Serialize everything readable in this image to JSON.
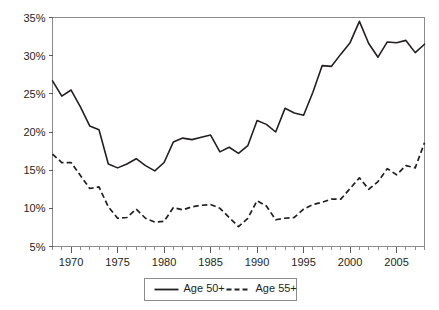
{
  "chart_data": {
    "type": "line",
    "title": "",
    "subtitle": "",
    "xlabel": "",
    "ylabel": "",
    "xlim": [
      1968,
      2008
    ],
    "ylim": [
      5,
      35
    ],
    "y_tick_labels": [
      "5%",
      "10%",
      "15%",
      "20%",
      "25%",
      "30%",
      "35%"
    ],
    "y_tick_values": [
      5,
      10,
      15,
      20,
      25,
      30,
      35
    ],
    "x_tick_labels": [
      "1970",
      "1975",
      "1980",
      "1985",
      "1990",
      "1995",
      "2000",
      "2005"
    ],
    "x_tick_values": [
      1970,
      1975,
      1980,
      1985,
      1990,
      1995,
      2000,
      2005
    ],
    "x_minor_tick_interval": 1,
    "grid": false,
    "legend_position": "bottom",
    "x": [
      1968,
      1969,
      1970,
      1971,
      1972,
      1973,
      1974,
      1975,
      1976,
      1977,
      1978,
      1979,
      1980,
      1981,
      1982,
      1983,
      1984,
      1985,
      1986,
      1987,
      1988,
      1989,
      1990,
      1991,
      1992,
      1993,
      1994,
      1995,
      1996,
      1997,
      1998,
      1999,
      2000,
      2001,
      2002,
      2003,
      2004,
      2005,
      2006,
      2007,
      2008
    ],
    "series": [
      {
        "name": "Age 50+",
        "style": "solid",
        "color": "#231f20",
        "values": [
          26.7,
          24.7,
          25.5,
          23.3,
          20.8,
          20.3,
          15.8,
          15.3,
          15.8,
          16.5,
          15.6,
          14.9,
          16.0,
          18.7,
          19.2,
          19.0,
          19.3,
          19.6,
          17.4,
          18.0,
          17.2,
          18.2,
          21.5,
          21.0,
          20.0,
          23.1,
          22.5,
          22.2,
          25.2,
          28.7,
          28.6,
          30.2,
          31.7,
          34.5,
          31.6,
          29.8,
          31.8,
          31.7,
          32.0,
          30.4,
          31.5
        ]
      },
      {
        "name": "Age 55+",
        "style": "dashed",
        "color": "#231f20",
        "values": [
          17.1,
          16.0,
          16.0,
          14.3,
          12.6,
          12.8,
          10.2,
          8.7,
          8.8,
          9.9,
          8.7,
          8.2,
          8.3,
          10.1,
          9.8,
          10.2,
          10.4,
          10.5,
          10.0,
          8.8,
          7.6,
          8.7,
          11.0,
          10.3,
          8.5,
          8.7,
          8.8,
          9.9,
          10.5,
          10.8,
          11.2,
          11.2,
          12.6,
          14.0,
          12.5,
          13.5,
          15.2,
          14.4,
          15.6,
          15.3,
          18.6
        ]
      }
    ]
  },
  "legend": {
    "entries": [
      {
        "label": "Age 50+",
        "style": "solid"
      },
      {
        "label": "Age 55+",
        "style": "dashed"
      }
    ]
  },
  "colors": {
    "line": "#231f20",
    "axis": "#8b8b8b",
    "background": "#ffffff"
  }
}
